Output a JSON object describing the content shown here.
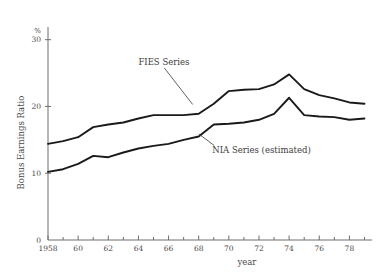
{
  "chart_data": {
    "type": "line",
    "title": "",
    "xlabel": "year",
    "ylabel": "Bonus Earnings Ratio",
    "yunit": "%",
    "xlim": [
      1958,
      1979.5
    ],
    "ylim": [
      0,
      31
    ],
    "yticks": [
      10,
      20,
      30
    ],
    "ytick_labels": [
      "10",
      "20",
      "30"
    ],
    "xticks": [
      1958,
      1960,
      1962,
      1964,
      1966,
      1968,
      1970,
      1972,
      1974,
      1976,
      1978
    ],
    "xtick_labels": [
      "1958",
      "60",
      "62",
      "64",
      "66",
      "68",
      "70",
      "72",
      "74",
      "76",
      "78"
    ],
    "xminor_ticks": [
      1959,
      1961,
      1963,
      1965,
      1967,
      1969,
      1971,
      1973,
      1975,
      1977,
      1979
    ],
    "origin_label": "0",
    "grid": false,
    "legend_position": "inline-annotations",
    "x": [
      1958,
      1959,
      1960,
      1961,
      1962,
      1963,
      1964,
      1965,
      1966,
      1967,
      1968,
      1969,
      1970,
      1971,
      1972,
      1973,
      1974,
      1975,
      1976,
      1977,
      1978,
      1979
    ],
    "series": [
      {
        "name": "FIES Series",
        "color": "#1a1a1a",
        "values": [
          14.4,
          14.8,
          15.4,
          16.9,
          17.3,
          17.6,
          18.2,
          18.7,
          18.7,
          18.7,
          18.9,
          20.4,
          22.3,
          22.5,
          22.6,
          23.3,
          24.8,
          22.6,
          21.7,
          21.2,
          20.6,
          20.4
        ]
      },
      {
        "name": "NIA Series (estimated)",
        "color": "#1a1a1a",
        "values": [
          10.2,
          10.6,
          11.4,
          12.6,
          12.4,
          13.1,
          13.7,
          14.1,
          14.4,
          15.0,
          15.5,
          17.3,
          17.4,
          17.6,
          18.0,
          18.9,
          21.3,
          18.7,
          18.5,
          18.4,
          18.0,
          18.2
        ]
      }
    ],
    "annotations": [
      {
        "text": "FIES Series",
        "x": 1964.0,
        "y": 26.2,
        "leader_to_x": 1967.6,
        "leader_to_y": 20.3
      },
      {
        "text": "NIA Series (estimated)",
        "x": 1968.9,
        "y": 13.1,
        "leader_to_x": 1968.0,
        "leader_to_y": 15.9
      }
    ]
  }
}
